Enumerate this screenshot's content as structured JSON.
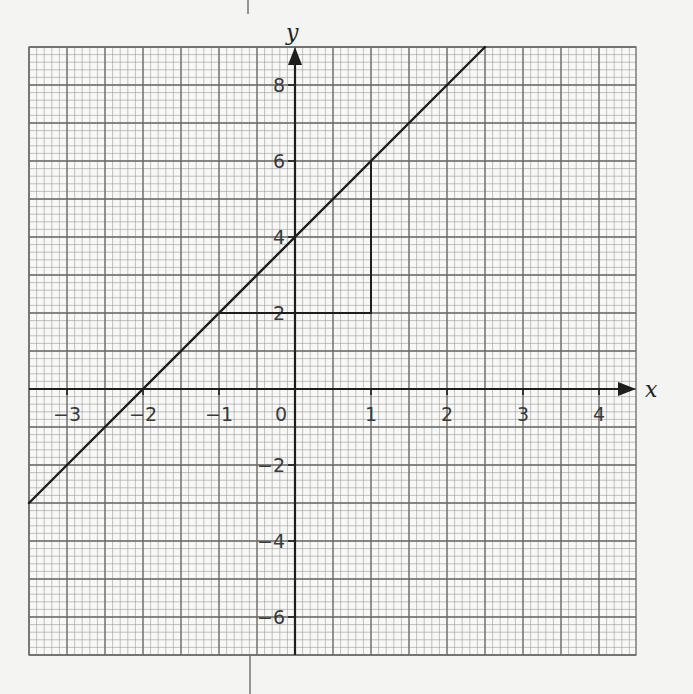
{
  "chart_data": {
    "type": "line",
    "title": "",
    "xlabel": "x",
    "ylabel": "y",
    "xlim": [
      -3.5,
      4.5
    ],
    "ylim": [
      -7,
      9
    ],
    "grid": true,
    "x_ticks": [
      -3,
      -2,
      -1,
      0,
      1,
      2,
      3,
      4
    ],
    "x_tick_labels": [
      "−3",
      "−2",
      "−1",
      "0",
      "1",
      "2",
      "3",
      "4"
    ],
    "y_ticks": [
      -6,
      -4,
      -2,
      2,
      4,
      6,
      8
    ],
    "y_tick_labels": [
      "−6",
      "−4",
      "−2",
      "2",
      "4",
      "6",
      "8"
    ],
    "series": [
      {
        "name": "y = 2x + 4",
        "x": [
          -3.5,
          2.5
        ],
        "y": [
          -3,
          9
        ]
      }
    ],
    "annotations": [
      {
        "type": "gradient-triangle",
        "points": [
          [
            -1,
            2
          ],
          [
            1,
            2
          ],
          [
            1,
            6
          ]
        ],
        "run": 2,
        "rise": 4
      }
    ]
  },
  "colors": {
    "paper": "#f4f4f2",
    "minor_grid": "#9a9a9a",
    "major_grid": "#6a6a6a",
    "ink": "#1e1e1e"
  }
}
